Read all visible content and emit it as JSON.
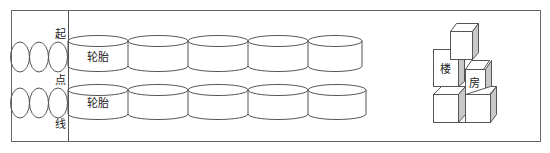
{
  "diagram": {
    "start_line_label": [
      "起",
      "点",
      "线"
    ],
    "tire_rows": [
      {
        "label": "轮胎",
        "count": 5
      },
      {
        "label": "轮胎",
        "count": 5
      }
    ],
    "left_circles_per_row": 3,
    "building_labels": {
      "left": "楼",
      "right": "房"
    },
    "colors": {
      "line": "#555555",
      "shade": "#c8c8c8",
      "background": "#ffffff"
    }
  }
}
